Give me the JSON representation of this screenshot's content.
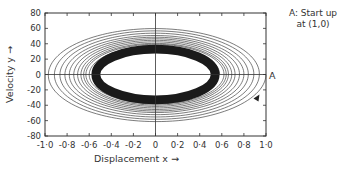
{
  "chart_data": {
    "type": "line",
    "title": "",
    "xlabel": "Displacement x",
    "ylabel": "Velocity y",
    "xlim": [
      -1.0,
      1.0
    ],
    "ylim": [
      -80,
      80
    ],
    "x_ticks": [
      "-1·0",
      "-0·8",
      "-0·6",
      "-0·4",
      "-0·2",
      "0",
      "0·2",
      "0·4",
      "0·6",
      "0·8",
      "1·0"
    ],
    "y_ticks": [
      "80",
      "60",
      "40",
      "20",
      "0",
      "-20",
      "-40",
      "-60",
      "-80"
    ],
    "grid": false,
    "start_point": {
      "label": "A",
      "x": 1.0,
      "y": 0
    },
    "trajectory_loops": [
      {
        "x_amp": 1.0,
        "y_amp": 62
      },
      {
        "x_amp": 0.94,
        "y_amp": 59
      },
      {
        "x_amp": 0.89,
        "y_amp": 56
      },
      {
        "x_amp": 0.84,
        "y_amp": 53
      },
      {
        "x_amp": 0.8,
        "y_amp": 50
      },
      {
        "x_amp": 0.76,
        "y_amp": 48
      },
      {
        "x_amp": 0.72,
        "y_amp": 46
      },
      {
        "x_amp": 0.69,
        "y_amp": 44
      },
      {
        "x_amp": 0.66,
        "y_amp": 42
      },
      {
        "x_amp": 0.64,
        "y_amp": 40
      },
      {
        "x_amp": 0.62,
        "y_amp": 39
      }
    ],
    "limit_cycle": {
      "x_amp_outer": 0.58,
      "x_amp_inner": 0.5,
      "y_amp_outer": 36,
      "y_amp_inner": 30
    },
    "arrow": {
      "x": 0.95,
      "y": -30,
      "direction": "clockwise"
    }
  },
  "annotation": {
    "line1": "A: Start up",
    "line2": "at (1,0)",
    "marker": "A"
  }
}
